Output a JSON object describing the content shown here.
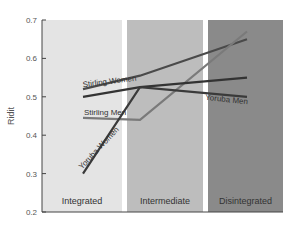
{
  "chart_data": {
    "type": "line",
    "title": "",
    "xlabel": "",
    "ylabel": "Ridit",
    "ylim": [
      0.2,
      0.7
    ],
    "yticks": [
      0.2,
      0.3,
      0.4,
      0.5,
      0.6,
      0.7
    ],
    "categories": [
      "Integrated",
      "Intermediate",
      "Disintegrated"
    ],
    "grid": false,
    "legend": "inline labels",
    "zones": [
      {
        "label": "Integrated",
        "color": "#e4e4e4"
      },
      {
        "label": "Intermediate",
        "color": "#bdbdbd"
      },
      {
        "label": "Disintegrated",
        "color": "#8a8a8a"
      }
    ],
    "series": [
      {
        "name": "Stirling Women",
        "values": [
          0.52,
          0.555,
          0.65
        ],
        "color": "#4a4a4a"
      },
      {
        "name": "Stirling Men",
        "values": [
          0.445,
          0.44,
          0.67
        ],
        "color": "#7a7a7a"
      },
      {
        "name": "Yoruba Men",
        "values": [
          0.5,
          0.525,
          0.55
        ],
        "color": "#333333"
      },
      {
        "name": "Yoruba Women",
        "values": [
          0.3,
          0.525,
          0.5
        ],
        "color": "#3a3a3a"
      }
    ]
  }
}
